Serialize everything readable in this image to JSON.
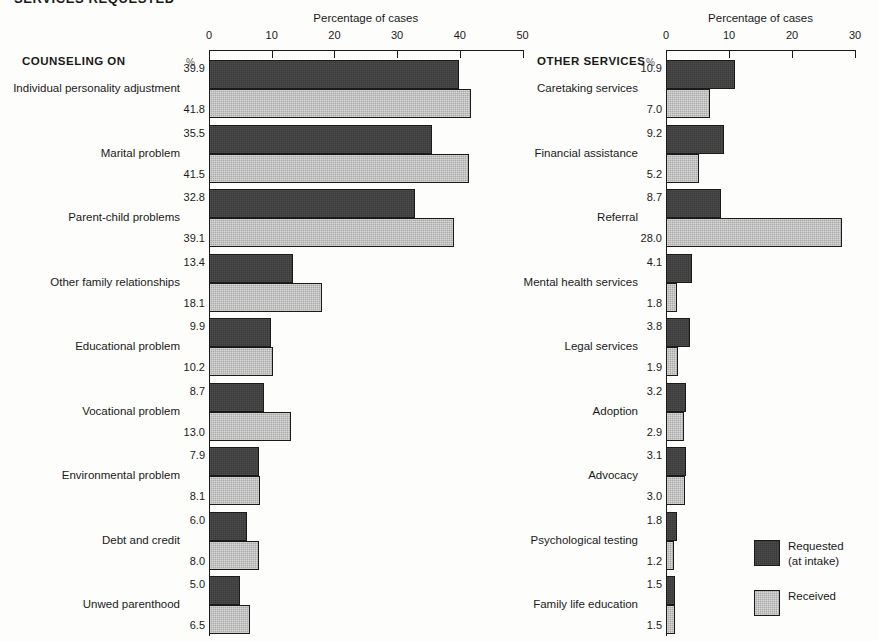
{
  "figure": {
    "title": "SERVICES REQUESTED"
  },
  "legend": {
    "position": "bottom-right",
    "entries": [
      {
        "key": "requested",
        "line1": "Requested",
        "line2": "(at intake)",
        "color": "#3b3b3b"
      },
      {
        "key": "received",
        "line1": "Received",
        "line2": "",
        "color": "#aaaaaa"
      }
    ]
  },
  "panels": [
    {
      "id": "left",
      "group_header": "COUNSELING ON",
      "pct_header": "%",
      "axis_title": "Percentage of cases",
      "xlim": [
        0,
        50
      ],
      "xticks": [
        0,
        10,
        20,
        30,
        40,
        50
      ],
      "xticklabels": [
        "0",
        "10",
        "20",
        "30",
        "40",
        "50"
      ]
    },
    {
      "id": "right",
      "group_header": "OTHER SERVICES",
      "pct_header": "%",
      "axis_title": "Percentage of cases",
      "xlim": [
        0,
        30
      ],
      "xticks": [
        0,
        10,
        20,
        30
      ],
      "xticklabels": [
        "0",
        "10",
        "20",
        "30"
      ]
    }
  ],
  "chart_data": [
    {
      "type": "bar",
      "orientation": "horizontal",
      "panel": "left",
      "title": "SERVICES REQUESTED",
      "xlabel": "Percentage of cases",
      "ylabel": "COUNSELING ON",
      "xlim": [
        0,
        50
      ],
      "xticks": [
        0,
        10,
        20,
        30,
        40,
        50
      ],
      "grid": false,
      "legend_position": "bottom-right",
      "categories": [
        "Individual personality adjustment",
        "Marital problem",
        "Parent-child problems",
        "Other family relationships",
        "Educational problem",
        "Vocational problem",
        "Environmental problem",
        "Debt and credit",
        "Unwed parenthood"
      ],
      "series": [
        {
          "name": "Requested (at intake)",
          "color": "#3b3b3b",
          "values": [
            39.9,
            35.5,
            32.8,
            13.4,
            9.9,
            8.7,
            7.9,
            6.0,
            5.0
          ],
          "labels": [
            "39.9",
            "35.5",
            "32.8",
            "13.4",
            "9.9",
            "8.7",
            "7.9",
            "6.0",
            "5.0"
          ]
        },
        {
          "name": "Received",
          "color": "#aaaaaa",
          "values": [
            41.8,
            41.5,
            39.1,
            18.1,
            10.2,
            13.0,
            8.1,
            8.0,
            6.5
          ],
          "labels": [
            "41.8",
            "41.5",
            "39.1",
            "18.1",
            "10.2",
            "13.0",
            "8.1",
            "8.0",
            "6.5"
          ]
        }
      ]
    },
    {
      "type": "bar",
      "orientation": "horizontal",
      "panel": "right",
      "title": "SERVICES REQUESTED",
      "xlabel": "Percentage of cases",
      "ylabel": "OTHER SERVICES",
      "xlim": [
        0,
        30
      ],
      "xticks": [
        0,
        10,
        20,
        30
      ],
      "grid": false,
      "legend_position": "bottom-right",
      "categories": [
        "Caretaking services",
        "Financial assistance",
        "Referral",
        "Mental health services",
        "Legal services",
        "Adoption",
        "Advocacy",
        "Psychological testing",
        "Family life education"
      ],
      "series": [
        {
          "name": "Requested (at intake)",
          "color": "#3b3b3b",
          "values": [
            10.9,
            9.2,
            8.7,
            4.1,
            3.8,
            3.2,
            3.1,
            1.8,
            1.5
          ],
          "labels": [
            "10.9",
            "9.2",
            "8.7",
            "4.1",
            "3.8",
            "3.2",
            "3.1",
            "1.8",
            "1.5"
          ]
        },
        {
          "name": "Received",
          "color": "#aaaaaa",
          "values": [
            7.0,
            5.2,
            28.0,
            1.8,
            1.9,
            2.9,
            3.0,
            1.2,
            1.5
          ],
          "labels": [
            "7.0",
            "5.2",
            "28.0",
            "1.8",
            "1.9",
            "2.9",
            "3.0",
            "1.2",
            "1.5"
          ]
        }
      ]
    }
  ]
}
